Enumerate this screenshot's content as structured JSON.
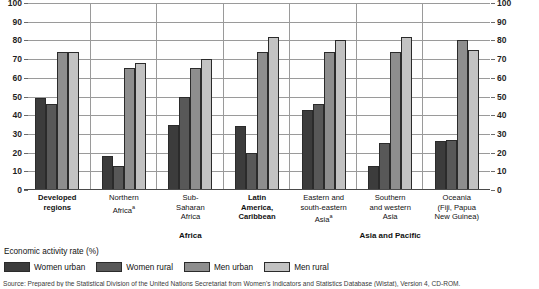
{
  "chart_data": {
    "type": "bar",
    "title": "",
    "xlabel": "",
    "ylabel": "Economic activity rate (%)",
    "ylim": [
      0,
      100
    ],
    "yticks": [
      0,
      10,
      20,
      30,
      40,
      50,
      60,
      70,
      80,
      90,
      100
    ],
    "grid": true,
    "legend_position": "bottom-left",
    "dual_y_axis": true,
    "categories": [
      "Developed regions",
      "Northern Africaᵃ",
      "Sub-Saharan Africa",
      "Latin America, Caribbean",
      "Eastern and south-eastern Asiaᵃ",
      "Southern and western Asia",
      "Oceania (Fiji, Papua New Guinea)"
    ],
    "series": [
      {
        "name": "Women urban",
        "color": "#3c3c3c",
        "values": [
          49,
          18,
          35,
          34,
          43,
          13,
          26
        ]
      },
      {
        "name": "Women rural",
        "color": "#585858",
        "values": [
          46,
          13,
          50,
          20,
          46,
          25,
          27
        ]
      },
      {
        "name": "Men urban",
        "color": "#8e8e8e",
        "values": [
          74,
          65,
          65,
          74,
          74,
          74,
          80
        ]
      },
      {
        "name": "Men rural",
        "color": "#c2c2c2",
        "values": [
          74,
          68,
          70,
          82,
          80,
          82,
          75
        ]
      }
    ],
    "groups_bands": [
      {
        "label": "Africa",
        "spans": [
          1,
          2,
          3
        ]
      },
      {
        "label": "Asia and Pacific",
        "spans": [
          4,
          5,
          6
        ]
      }
    ]
  },
  "category_labels": [
    {
      "lines": [
        "Developed",
        "regions"
      ],
      "bold": true,
      "sup": ""
    },
    {
      "lines": [
        "Northern",
        "Africa"
      ],
      "bold": false,
      "sup": "a"
    },
    {
      "lines": [
        "Sub-",
        "Saharan",
        "Africa"
      ],
      "bold": false,
      "sup": ""
    },
    {
      "lines": [
        "Latin",
        "America,",
        "Caribbean"
      ],
      "bold": true,
      "sup": ""
    },
    {
      "lines": [
        "Eastern and",
        "south-eastern",
        "Asia"
      ],
      "bold": false,
      "sup": "a"
    },
    {
      "lines": [
        "Southern",
        "and western",
        "Asia"
      ],
      "bold": false,
      "sup": ""
    },
    {
      "lines": [
        "Oceania",
        "(Fiji, Papua",
        "New Guinea)"
      ],
      "bold": false,
      "sup": ""
    }
  ],
  "bands": [
    {
      "label": "Africa"
    },
    {
      "label": "Asia and Pacific"
    }
  ],
  "legend": {
    "title": "Economic activity rate (%)",
    "items": [
      {
        "label": "Women urban"
      },
      {
        "label": "Women rural"
      },
      {
        "label": "Men urban"
      },
      {
        "label": "Men rural"
      }
    ]
  },
  "source": {
    "text": "Source: Prepared by the Statistical Division of the United Nations Secretariat from Women's Indicators and Statistics Database (Wistat), Version 4, CD-ROM."
  }
}
